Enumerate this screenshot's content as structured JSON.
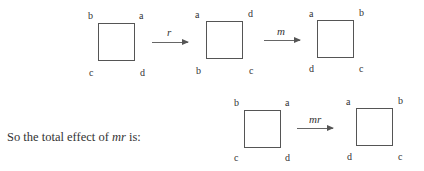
{
  "diagram_top": {
    "squares": [
      {
        "corners": {
          "tl": "b",
          "tr": "a",
          "bl": "c",
          "br": "d"
        }
      },
      {
        "corners": {
          "tl": "a",
          "tr": "d",
          "bl": "b",
          "br": "c"
        }
      },
      {
        "corners": {
          "tl": "a",
          "tr": "b",
          "bl": "d",
          "br": "c"
        }
      }
    ],
    "arrows": [
      {
        "label": "r"
      },
      {
        "label": "m"
      }
    ]
  },
  "sentence": {
    "prefix": "So the total effect of ",
    "math": "mr",
    "suffix": " is:"
  },
  "diagram_bottom": {
    "squares": [
      {
        "corners": {
          "tl": "b",
          "tr": "a",
          "bl": "c",
          "br": "d"
        }
      },
      {
        "corners": {
          "tl": "a",
          "tr": "b",
          "bl": "d",
          "br": "c"
        }
      }
    ],
    "arrows": [
      {
        "label": "mr"
      }
    ]
  }
}
